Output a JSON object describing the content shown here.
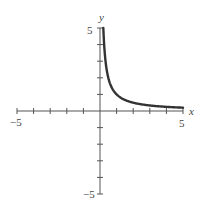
{
  "chart_data": {
    "type": "line",
    "title": "",
    "xlabel": "x",
    "ylabel": "y",
    "xlim": [
      -5,
      5
    ],
    "ylim": [
      -5,
      5
    ],
    "grid": false,
    "tick_labels": {
      "x_min": "−5",
      "x_max": "5",
      "y_max": "5",
      "y_min": "−5"
    },
    "series": [
      {
        "name": "y = 1/x",
        "x": [
          0.2,
          0.25,
          0.3,
          0.4,
          0.5,
          0.75,
          1,
          1.5,
          2,
          2.5,
          3,
          3.5,
          4,
          4.5,
          5
        ],
        "y": [
          5,
          4,
          3.33,
          2.5,
          2,
          1.33,
          1,
          0.67,
          0.5,
          0.4,
          0.33,
          0.29,
          0.25,
          0.22,
          0.2
        ]
      }
    ]
  }
}
